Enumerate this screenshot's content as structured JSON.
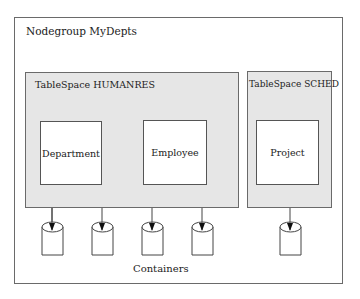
{
  "nodegroup": {
    "label": "Nodegroup  MyDepts"
  },
  "tablespaces": [
    {
      "label": "TableSpace HUMANRES",
      "tables": [
        {
          "label": "Department"
        },
        {
          "label": "Employee"
        }
      ]
    },
    {
      "label": "TableSpace SCHED",
      "tables": [
        {
          "label": "Project"
        }
      ]
    }
  ],
  "containers": {
    "label": "Containers",
    "count": 5,
    "icon": "cylinder-icon"
  },
  "colors": {
    "tablespace_fill": "#e6e6e6",
    "border": "#6a6a6a",
    "table_fill": "#ffffff"
  }
}
